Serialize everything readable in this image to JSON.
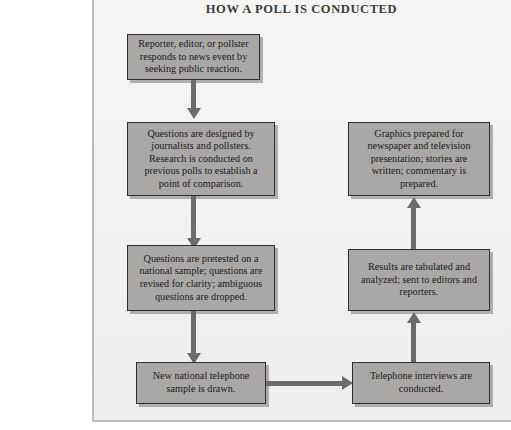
{
  "figure": {
    "title": "HOW A POLL IS CONDUCTED",
    "colors": {
      "box_fill": "#a9a8a6",
      "box_border": "#2e2e2e",
      "connector": "#6c6b69",
      "paper": "#f4f3f1",
      "page": "#ffffff",
      "text": "#1a1a1a"
    }
  },
  "nodes": [
    {
      "id": "step-1",
      "column": "left",
      "order": 1,
      "text": "Reporter, editor, or pollster responds to news event by seeking public reaction."
    },
    {
      "id": "step-2",
      "column": "left",
      "order": 2,
      "text": "Questions are designed by journalists and pollsters. Research is conducted on previous polls to establish a point of comparison."
    },
    {
      "id": "step-3",
      "column": "left",
      "order": 3,
      "text": "Questions are pretested on a national sample; questions are revised for clarity; ambiguous questions are dropped."
    },
    {
      "id": "step-4",
      "column": "left",
      "order": 4,
      "text": "New national telephone sample is drawn."
    },
    {
      "id": "step-5",
      "column": "right",
      "order": 5,
      "text": "Telephone interviews are conducted."
    },
    {
      "id": "step-6",
      "column": "right",
      "order": 6,
      "text": "Results are tabulated and analyzed; sent to editors and reporters."
    },
    {
      "id": "step-7",
      "column": "right",
      "order": 7,
      "text": "Graphics prepared for newspaper and television presentation; stories are written; commentary is prepared."
    }
  ],
  "connectors": [
    {
      "id": "c1",
      "from": "step-1",
      "to": "step-2",
      "direction": "down"
    },
    {
      "id": "c2",
      "from": "step-2",
      "to": "step-3",
      "direction": "down"
    },
    {
      "id": "c3",
      "from": "step-3",
      "to": "step-4",
      "direction": "down"
    },
    {
      "id": "c4",
      "from": "step-4",
      "to": "step-5",
      "direction": "right"
    },
    {
      "id": "c5",
      "from": "step-5",
      "to": "step-6",
      "direction": "up"
    },
    {
      "id": "c6",
      "from": "step-6",
      "to": "step-7",
      "direction": "up"
    }
  ]
}
